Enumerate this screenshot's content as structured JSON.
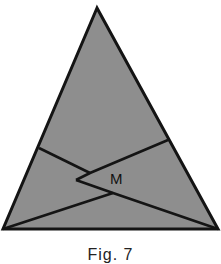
{
  "figure": {
    "label_M": "M",
    "caption": "Fig. 7",
    "fill_color": "#8e8e8e",
    "stroke_color": "#141414",
    "points": {
      "apex": [
        97,
        8
      ],
      "bottom_left": [
        3,
        229
      ],
      "bottom_right": [
        218,
        229
      ],
      "left_side": [
        39,
        148
      ],
      "right_side": [
        168,
        140
      ],
      "upper_junction": [
        90,
        173
      ],
      "notch": [
        76,
        180
      ],
      "lower_junction": [
        113,
        193
      ],
      "label_M_pos": [
        119,
        178
      ]
    }
  }
}
